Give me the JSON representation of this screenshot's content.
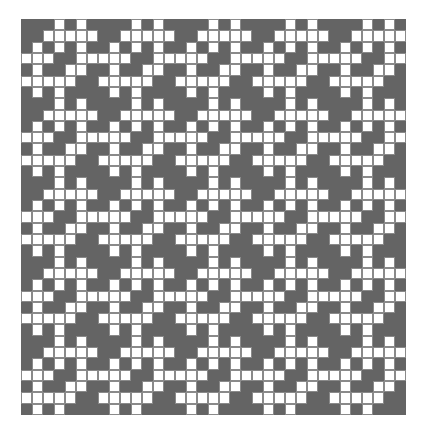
{
  "diagram": {
    "type": "weave-draft-grid",
    "rows": 35,
    "cols": 35,
    "colors": {
      "filled": "#646464",
      "empty": "#ffffff",
      "cell_border": "#8a8a8a",
      "page_background": "#ffffff"
    },
    "repeat_tile": {
      "size": 7,
      "white_columns_by_row": [
        [
          3,
          5
        ],
        [
          2,
          3,
          4,
          5,
          6
        ],
        [
          1,
          3,
          5
        ],
        [
          0,
          1,
          2,
          5,
          6
        ],
        [
          1,
          4,
          5
        ],
        [
          0,
          1,
          2,
          3,
          4
        ],
        [
          1,
          3
        ]
      ]
    }
  }
}
